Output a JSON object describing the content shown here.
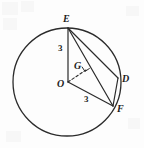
{
  "figure": {
    "type": "geometry-diagram",
    "background_color": "#fdfdfd",
    "stroke_color": "#2b2b2b",
    "text_color": "#1b1b1b"
  },
  "circle": {
    "name": "circle-O",
    "center": {
      "x": 67,
      "y": 82
    },
    "radius": 54
  },
  "points": [
    {
      "id": "E",
      "label": "E",
      "x": 68,
      "y": 28,
      "label_x": 63,
      "label_y": 14
    },
    {
      "id": "D",
      "label": "D",
      "x": 118,
      "y": 78,
      "label_x": 122,
      "label_y": 74
    },
    {
      "id": "F",
      "label": "F",
      "x": 113,
      "y": 106,
      "label_x": 117,
      "label_y": 104
    },
    {
      "id": "O",
      "label": "O",
      "x": 68,
      "y": 82,
      "label_x": 57,
      "label_y": 79
    },
    {
      "id": "G",
      "label": "G",
      "x": 86,
      "y": 70,
      "label_x": 74,
      "label_y": 61
    }
  ],
  "segments": [
    {
      "id": "EO",
      "from": "E",
      "to": "O",
      "style": "solid"
    },
    {
      "id": "ED",
      "from": "E",
      "to": "D",
      "style": "solid"
    },
    {
      "id": "EF",
      "from": "E",
      "to": "F",
      "style": "solid"
    },
    {
      "id": "DF",
      "from": "D",
      "to": "F",
      "style": "solid"
    },
    {
      "id": "OF",
      "from": "O",
      "to": "F",
      "style": "solid"
    },
    {
      "id": "OG",
      "from": "O",
      "to": "G",
      "style": "dashed"
    }
  ],
  "measurements": [
    {
      "id": "EO-length",
      "value": "3",
      "x": 58,
      "y": 44
    },
    {
      "id": "OF-length",
      "value": "3",
      "x": 84,
      "y": 95
    }
  ],
  "marks": [
    {
      "id": "right-angle-at-G",
      "type": "right-angle-square",
      "x": 86,
      "y": 70
    }
  ]
}
